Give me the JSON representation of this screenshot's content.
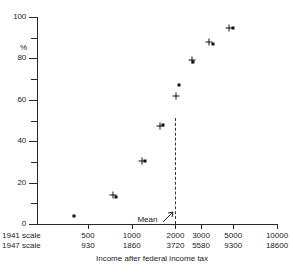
{
  "chart_data": {
    "type": "scatter",
    "title": "",
    "xlabel": "Income after federal income tax",
    "ylabel": "%",
    "ylim": [
      0,
      100
    ],
    "yticks": [
      0,
      20,
      40,
      60,
      80,
      100
    ],
    "yminor": [
      10,
      30,
      50,
      70,
      90
    ],
    "xscale": "log",
    "xlim": [
      300,
      10000
    ],
    "xticks_1941": [
      "500",
      "1000",
      "2000",
      "3000",
      "5000",
      "10000"
    ],
    "xticks_1947": [
      "930",
      "1860",
      "3720",
      "5580",
      "9300",
      "18600"
    ],
    "xtick_values": [
      500,
      1000,
      2000,
      3000,
      5000,
      10000
    ],
    "scale_label_1941": "1941 scale",
    "scale_label_1947": "1947 scale",
    "grid": false,
    "legend": "none",
    "annotation_mean": "Mean",
    "mean_value": 2000,
    "series": [
      {
        "name": "dot",
        "marker": "filled-square",
        "points": [
          {
            "x": 400,
            "y": 4
          },
          {
            "x": 780,
            "y": 13
          },
          {
            "x": 1230,
            "y": 30.5
          },
          {
            "x": 1640,
            "y": 48
          },
          {
            "x": 2100,
            "y": 67
          },
          {
            "x": 2650,
            "y": 78.5
          },
          {
            "x": 3600,
            "y": 87
          },
          {
            "x": 5000,
            "y": 94.5
          }
        ]
      },
      {
        "name": "plus",
        "marker": "plus",
        "points": [
          {
            "x": 740,
            "y": 14
          },
          {
            "x": 1180,
            "y": 30.5
          },
          {
            "x": 1560,
            "y": 47.5
          },
          {
            "x": 2020,
            "y": 62
          },
          {
            "x": 2600,
            "y": 79
          },
          {
            "x": 3400,
            "y": 88
          },
          {
            "x": 4700,
            "y": 94.5
          }
        ]
      }
    ]
  },
  "axes": {
    "y_unit": "%"
  }
}
